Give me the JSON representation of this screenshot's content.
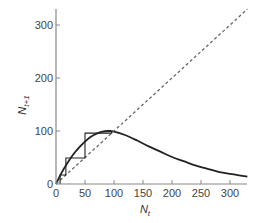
{
  "chart_data": {
    "type": "line",
    "title": "",
    "xlabel": "N_t",
    "ylabel": "N_t+1",
    "xlabel_main": "N",
    "xlabel_sub": "t",
    "ylabel_main": "N",
    "ylabel_sub": "t+1",
    "xlim": [
      0,
      330
    ],
    "ylim": [
      0,
      330
    ],
    "x_ticks": [
      0,
      50,
      100,
      150,
      200,
      250,
      300
    ],
    "y_ticks": [
      0,
      100,
      200,
      300
    ],
    "grid": false,
    "legend": null,
    "series": [
      {
        "name": "recruitment curve",
        "style": "solid",
        "color": "#222222",
        "x": [
          0,
          10,
          20,
          30,
          40,
          50,
          60,
          70,
          80,
          90,
          100,
          120,
          140,
          160,
          180,
          200,
          220,
          240,
          260,
          280,
          300,
          330
        ],
        "y": [
          0,
          22,
          40,
          56,
          69,
          80,
          89,
          95,
          99,
          100,
          99,
          92,
          82,
          71,
          61,
          51,
          43,
          35,
          29,
          23,
          19,
          14
        ]
      },
      {
        "name": "replacement line (N_t+1 = N_t)",
        "style": "dashed",
        "color": "#666666",
        "x": [
          0,
          330
        ],
        "y": [
          0,
          330
        ]
      },
      {
        "name": "cobweb trajectory",
        "style": "solid",
        "color": "#222222",
        "x": [
          7,
          7,
          17,
          17,
          50,
          50,
          96,
          96
        ],
        "y": [
          0,
          17,
          17,
          49,
          49,
          96,
          96,
          100
        ]
      }
    ]
  }
}
